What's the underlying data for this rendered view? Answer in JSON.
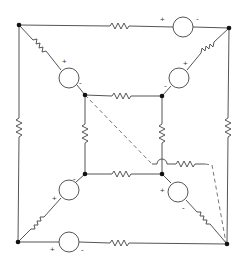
{
  "diagram": {
    "type": "circuit-schematic",
    "colors": {
      "wire": "#555555",
      "node": "#111111",
      "dashed": "#777777",
      "background": "#ffffff"
    },
    "nodes": [
      {
        "id": "outer-top-left",
        "x": 19,
        "y": 25
      },
      {
        "id": "outer-top-right",
        "x": 229,
        "y": 28
      },
      {
        "id": "outer-bottom-left",
        "x": 18,
        "y": 242
      },
      {
        "id": "outer-bottom-right",
        "x": 227,
        "y": 244
      },
      {
        "id": "inner-top-left",
        "x": 85,
        "y": 95
      },
      {
        "id": "inner-top-right",
        "x": 162,
        "y": 96
      },
      {
        "id": "inner-bottom-left",
        "x": 85,
        "y": 174
      },
      {
        "id": "inner-bottom-right",
        "x": 162,
        "y": 174
      }
    ],
    "sources": [
      {
        "id": "top-source",
        "plus": "+",
        "minus": "-"
      },
      {
        "id": "bottom-source",
        "plus": "+",
        "minus": "-"
      },
      {
        "id": "diag-top-left-source",
        "plus": "+",
        "minus": "-"
      },
      {
        "id": "diag-top-right-source",
        "plus": "+",
        "minus": "-"
      },
      {
        "id": "diag-bottom-left-source",
        "plus": "+",
        "minus": "-"
      },
      {
        "id": "diag-bottom-right-source",
        "plus": "+",
        "minus": "-"
      }
    ],
    "resistor_count": 13,
    "dashed_branch": "inner-top-left to outer-bottom-right via resistor"
  }
}
